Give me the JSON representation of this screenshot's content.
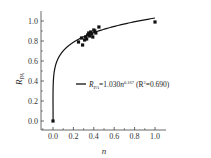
{
  "chart_data": {
    "type": "scatter",
    "title": "",
    "xlabel": "n",
    "ylabel": "R_PA",
    "ylabel_main": "R",
    "ylabel_sub": "PA",
    "xlim": [
      -0.1,
      1.1
    ],
    "ylim": [
      -0.05,
      1.1
    ],
    "xticks": [
      "0.0",
      "0.2",
      "0.4",
      "0.6",
      "0.8",
      "1.0"
    ],
    "yticks": [
      "0.0",
      "0.2",
      "0.4",
      "0.6",
      "0.8",
      "1.0"
    ],
    "grid": false,
    "legend_position": "center-right",
    "series": [
      {
        "name": "observed",
        "type": "scatter",
        "marker": "square",
        "points": [
          [
            0.0,
            0.0
          ],
          [
            0.25,
            0.79
          ],
          [
            0.28,
            0.83
          ],
          [
            0.29,
            0.76
          ],
          [
            0.31,
            0.81
          ],
          [
            0.32,
            0.84
          ],
          [
            0.33,
            0.82
          ],
          [
            0.34,
            0.86
          ],
          [
            0.35,
            0.88
          ],
          [
            0.36,
            0.85
          ],
          [
            0.37,
            0.89
          ],
          [
            0.38,
            0.87
          ],
          [
            0.39,
            0.84
          ],
          [
            0.4,
            0.91
          ],
          [
            0.41,
            0.9
          ],
          [
            0.42,
            0.88
          ],
          [
            0.45,
            0.94
          ],
          [
            1.0,
            0.99
          ]
        ]
      },
      {
        "name": "fit",
        "type": "line",
        "equation": "R_PA = 1.030 n^0.167",
        "coefficient": 1.03,
        "exponent": 0.167,
        "r_squared": 0.69
      }
    ],
    "legend": {
      "line_label_main": "R",
      "line_label_sub": "PA",
      "line_label_eq": "=1.030",
      "line_label_n": "n",
      "line_label_exp": "0.167",
      "line_label_r2_open": " (R",
      "line_label_r2_sup": "2",
      "line_label_r2_close": "=0.690)"
    }
  }
}
